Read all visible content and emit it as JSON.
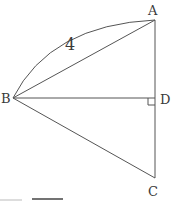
{
  "diagram": {
    "type": "geometry",
    "points": {
      "A": {
        "label": "A",
        "x": 155,
        "y": 20
      },
      "B": {
        "label": "B",
        "x": 13,
        "y": 98
      },
      "C": {
        "label": "C",
        "x": 155,
        "y": 178
      },
      "D": {
        "label": "D",
        "x": 155,
        "y": 98
      }
    },
    "segments": [
      "AB",
      "BD",
      "BC",
      "AD",
      "DC"
    ],
    "arc": {
      "from": "B",
      "to": "A",
      "label": "4"
    },
    "right_angle_at": "D",
    "colors": {
      "stroke": "#555555",
      "text": "#3a3a3a"
    }
  }
}
